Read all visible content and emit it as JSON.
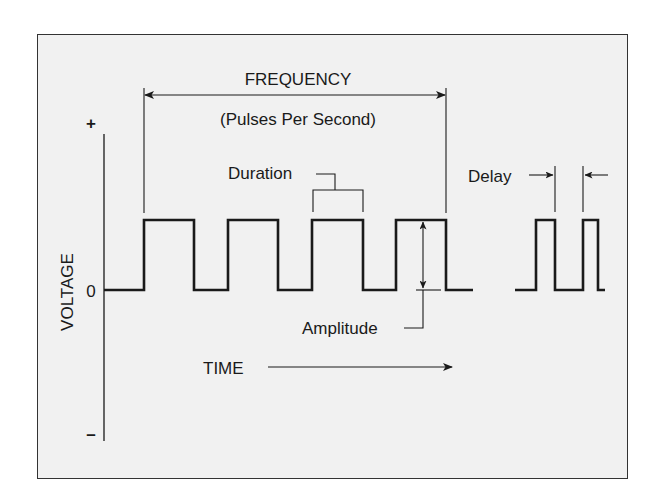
{
  "diagram": {
    "labels": {
      "frequency": "FREQUENCY",
      "frequency_sub": "(Pulses Per Second)",
      "duration": "Duration",
      "delay": "Delay",
      "amplitude": "Amplitude",
      "time": "TIME",
      "voltage": "VOLTAGE",
      "plus": "+",
      "zero": "0",
      "minus": "–"
    },
    "colors": {
      "background": "#f1f1f1",
      "line": "#1a1a1a",
      "frame": "#333333"
    },
    "waveform": {
      "baseline_y": 290,
      "high_y": 220,
      "main_pulses": [
        {
          "rise": 144,
          "fall": 194
        },
        {
          "rise": 228,
          "fall": 278
        },
        {
          "rise": 312,
          "fall": 363
        },
        {
          "rise": 396,
          "fall": 446
        }
      ],
      "main_start_x": 104,
      "main_end_x": 473,
      "delay_pulses": [
        {
          "rise": 536,
          "fall": 555
        },
        {
          "rise": 583,
          "fall": 598
        }
      ],
      "delay_start_x": 515,
      "delay_end_x": 605
    }
  }
}
